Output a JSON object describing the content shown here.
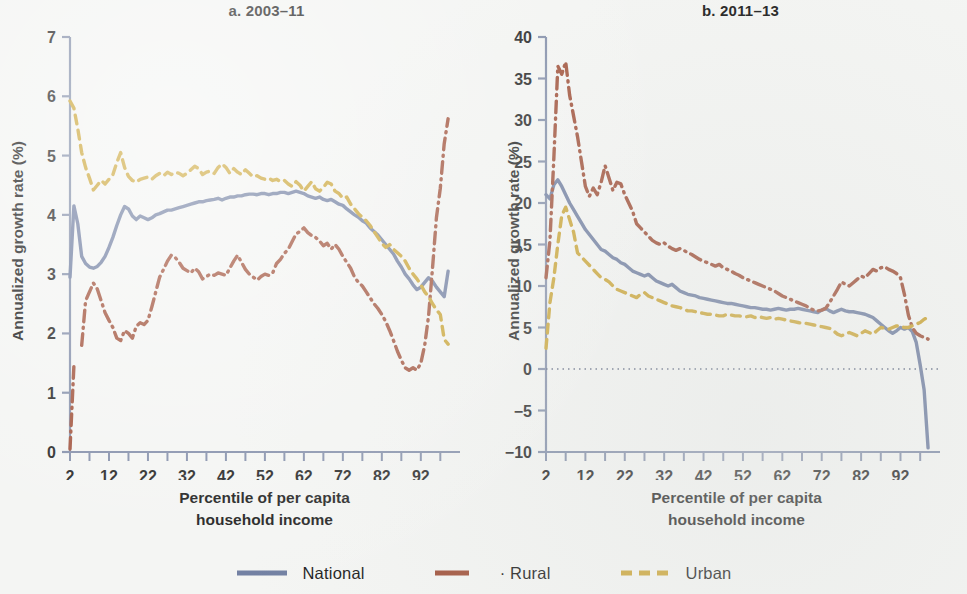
{
  "figure": {
    "background_color": "#f4f5f3",
    "legend": {
      "items": [
        {
          "label": "National",
          "color": "#6b7a9e",
          "style": "solid"
        },
        {
          "label": "· Rural",
          "color": "#9d4b33",
          "style": "dash-dot"
        },
        {
          "label": "Urban",
          "color": "#c9a12c",
          "style": "dashed"
        }
      ]
    }
  },
  "panels": {
    "a": {
      "title": "a. 2003–11",
      "xlabel_line1": "Percentile of per capita",
      "xlabel_line2": "household income",
      "ylabel": "Annualized growth rate (%)",
      "yticks": [
        "0",
        "1",
        "2",
        "3",
        "4",
        "5",
        "6",
        "7"
      ],
      "xticks": [
        "2",
        "12",
        "22",
        "32",
        "42",
        "52",
        "62",
        "72",
        "82",
        "92"
      ]
    },
    "b": {
      "title": "b. 2011–13",
      "xlabel_line1": "Percentile of per capita",
      "xlabel_line2": "household income",
      "ylabel": "Annualized growth rate (%)",
      "yticks": [
        "−10",
        "−5",
        "0",
        "5",
        "10",
        "15",
        "20",
        "25",
        "30",
        "35",
        "40"
      ],
      "xticks": [
        "2",
        "12",
        "22",
        "32",
        "42",
        "52",
        "62",
        "72",
        "82",
        "92"
      ]
    }
  },
  "chart_data": [
    {
      "id": "a",
      "type": "line",
      "title": "a. 2003–11",
      "xlabel": "Percentile of per capita household income",
      "ylabel": "Annualized growth rate (%)",
      "xlim": [
        2,
        100
      ],
      "ylim": [
        0,
        7
      ],
      "ytick_values": [
        0,
        1,
        2,
        3,
        4,
        5,
        6,
        7
      ],
      "xtick_values": [
        2,
        12,
        22,
        32,
        42,
        52,
        62,
        72,
        82,
        92
      ],
      "xtick_minor_step": 5,
      "grid": false,
      "zero_line": false,
      "legend_position": "below-figure",
      "x": [
        2,
        3,
        4,
        5,
        6,
        7,
        8,
        9,
        10,
        11,
        12,
        13,
        14,
        15,
        16,
        17,
        18,
        19,
        20,
        21,
        22,
        23,
        24,
        25,
        26,
        27,
        28,
        29,
        30,
        31,
        32,
        33,
        34,
        35,
        36,
        37,
        38,
        39,
        40,
        41,
        42,
        43,
        44,
        45,
        46,
        47,
        48,
        49,
        50,
        51,
        52,
        53,
        54,
        55,
        56,
        57,
        58,
        59,
        60,
        61,
        62,
        63,
        64,
        65,
        66,
        67,
        68,
        69,
        70,
        71,
        72,
        73,
        74,
        75,
        76,
        77,
        78,
        79,
        80,
        81,
        82,
        83,
        84,
        85,
        86,
        87,
        88,
        89,
        90,
        91,
        92,
        93,
        94,
        95,
        96,
        97,
        98,
        99
      ],
      "series": [
        {
          "name": "National",
          "color": "#6b7a9e",
          "style": "solid",
          "values": [
            2.95,
            4.15,
            3.85,
            3.3,
            3.18,
            3.12,
            3.1,
            3.13,
            3.2,
            3.3,
            3.45,
            3.62,
            3.82,
            4.0,
            4.14,
            4.1,
            3.98,
            3.92,
            3.98,
            3.95,
            3.92,
            3.95,
            4.0,
            4.02,
            4.05,
            4.08,
            4.08,
            4.1,
            4.12,
            4.14,
            4.16,
            4.18,
            4.2,
            4.22,
            4.22,
            4.24,
            4.25,
            4.26,
            4.28,
            4.25,
            4.28,
            4.3,
            4.3,
            4.32,
            4.32,
            4.34,
            4.35,
            4.35,
            4.34,
            4.36,
            4.36,
            4.34,
            4.36,
            4.36,
            4.38,
            4.38,
            4.36,
            4.38,
            4.4,
            4.38,
            4.36,
            4.32,
            4.3,
            4.28,
            4.3,
            4.26,
            4.24,
            4.26,
            4.22,
            4.18,
            4.16,
            4.1,
            4.05,
            4.0,
            3.96,
            3.9,
            3.86,
            3.78,
            3.72,
            3.66,
            3.58,
            3.5,
            3.42,
            3.34,
            3.22,
            3.12,
            3.0,
            2.92,
            2.82,
            2.74,
            2.78,
            2.86,
            2.94,
            2.88,
            2.78,
            2.7,
            2.62,
            3.05
          ]
        },
        {
          "name": "Rural",
          "color": "#9d4b33",
          "style": "dash-dot",
          "values": [
            0.05,
            1.45,
            null,
            1.8,
            2.55,
            2.7,
            2.85,
            2.75,
            2.55,
            2.35,
            2.22,
            2.1,
            1.92,
            1.88,
            2.05,
            2.0,
            1.92,
            2.12,
            2.18,
            2.15,
            2.22,
            2.45,
            2.7,
            2.95,
            3.08,
            3.22,
            3.32,
            3.28,
            3.2,
            3.1,
            3.06,
            3.02,
            3.1,
            3.04,
            2.92,
            2.96,
            3.0,
            2.98,
            3.02,
            3.0,
            2.98,
            3.1,
            3.22,
            3.32,
            3.2,
            3.08,
            3.0,
            2.95,
            2.9,
            2.96,
            3.0,
            2.98,
            3.02,
            3.18,
            3.25,
            3.35,
            3.42,
            3.55,
            3.68,
            3.72,
            3.78,
            3.7,
            3.65,
            3.62,
            3.56,
            3.48,
            3.52,
            3.42,
            3.5,
            3.42,
            3.3,
            3.2,
            3.1,
            2.95,
            2.86,
            2.8,
            2.7,
            2.6,
            2.5,
            2.42,
            2.32,
            2.2,
            2.05,
            1.88,
            1.7,
            1.55,
            1.42,
            1.38,
            1.42,
            1.38,
            1.5,
            1.8,
            2.3,
            3.1,
            3.95,
            4.45,
            5.2,
            5.62
          ]
        },
        {
          "name": "Urban",
          "color": "#c9a12c",
          "style": "dashed",
          "values": [
            5.92,
            5.8,
            5.45,
            5.05,
            4.8,
            4.62,
            4.42,
            4.5,
            4.58,
            4.52,
            4.6,
            4.68,
            4.88,
            5.05,
            4.8,
            4.65,
            4.58,
            4.55,
            4.6,
            4.62,
            4.64,
            4.6,
            4.66,
            4.7,
            4.66,
            4.72,
            4.68,
            4.72,
            4.7,
            4.66,
            4.7,
            4.76,
            4.82,
            4.78,
            4.68,
            4.72,
            4.74,
            4.7,
            4.8,
            4.86,
            4.8,
            4.7,
            4.78,
            4.72,
            4.68,
            4.76,
            4.7,
            4.64,
            4.66,
            4.62,
            4.6,
            4.62,
            4.58,
            4.6,
            4.56,
            4.58,
            4.52,
            4.48,
            4.56,
            4.5,
            4.4,
            4.48,
            4.56,
            4.44,
            4.4,
            4.46,
            4.55,
            4.52,
            4.4,
            4.36,
            4.28,
            4.3,
            4.18,
            4.1,
            4.02,
            3.96,
            3.9,
            3.82,
            3.72,
            3.62,
            3.52,
            3.45,
            3.5,
            3.42,
            3.36,
            3.3,
            3.22,
            3.1,
            3.0,
            2.92,
            2.82,
            2.7,
            2.62,
            2.5,
            2.4,
            2.32,
            1.9,
            1.82
          ]
        }
      ]
    },
    {
      "id": "b",
      "type": "line",
      "title": "b. 2011–13",
      "xlabel": "Percentile of per capita household income",
      "ylabel": "Annualized growth rate (%)",
      "xlim": [
        2,
        100
      ],
      "ylim": [
        -10,
        40
      ],
      "ytick_values": [
        -10,
        -5,
        0,
        5,
        10,
        15,
        20,
        25,
        30,
        35,
        40
      ],
      "xtick_values": [
        2,
        12,
        22,
        32,
        42,
        52,
        62,
        72,
        82,
        92
      ],
      "xtick_minor_step": 5,
      "grid": false,
      "zero_line": true,
      "legend_position": "below-figure",
      "x": [
        2,
        3,
        4,
        5,
        6,
        7,
        8,
        9,
        10,
        11,
        12,
        13,
        14,
        15,
        16,
        17,
        18,
        19,
        20,
        21,
        22,
        23,
        24,
        25,
        26,
        27,
        28,
        29,
        30,
        31,
        32,
        33,
        34,
        35,
        36,
        37,
        38,
        39,
        40,
        41,
        42,
        43,
        44,
        45,
        46,
        47,
        48,
        49,
        50,
        51,
        52,
        53,
        54,
        55,
        56,
        57,
        58,
        59,
        60,
        61,
        62,
        63,
        64,
        65,
        66,
        67,
        68,
        69,
        70,
        71,
        72,
        73,
        74,
        75,
        76,
        77,
        78,
        79,
        80,
        81,
        82,
        83,
        84,
        85,
        86,
        87,
        88,
        89,
        90,
        91,
        92,
        93,
        94,
        95,
        96,
        97,
        98,
        99
      ],
      "series": [
        {
          "name": "National",
          "color": "#6b7a9e",
          "style": "solid",
          "values": [
            21.0,
            20.5,
            22.2,
            22.8,
            22.0,
            21.0,
            20.0,
            19.2,
            18.4,
            17.6,
            16.8,
            16.2,
            15.6,
            15.0,
            14.4,
            14.2,
            13.8,
            13.4,
            13.2,
            12.8,
            12.6,
            12.2,
            11.8,
            11.6,
            11.4,
            11.2,
            11.4,
            11.0,
            10.6,
            10.4,
            10.2,
            10.0,
            10.2,
            9.8,
            9.4,
            9.2,
            9.0,
            8.9,
            8.8,
            8.6,
            8.5,
            8.4,
            8.3,
            8.2,
            8.1,
            8.0,
            7.9,
            7.9,
            7.8,
            7.7,
            7.6,
            7.5,
            7.4,
            7.4,
            7.3,
            7.2,
            7.2,
            7.1,
            7.2,
            7.3,
            7.2,
            7.1,
            7.2,
            7.2,
            7.3,
            7.2,
            7.1,
            7.0,
            6.9,
            6.8,
            7.1,
            7.3,
            7.0,
            6.8,
            7.0,
            7.2,
            7.0,
            6.9,
            6.9,
            6.8,
            6.7,
            6.6,
            6.4,
            6.2,
            5.8,
            5.4,
            5.0,
            4.6,
            4.3,
            4.6,
            5.0,
            4.8,
            5.0,
            4.5,
            3.2,
            0.5,
            -2.5,
            -9.5
          ]
        },
        {
          "name": "Rural",
          "color": "#9d4b33",
          "style": "dash-dot",
          "values": [
            11.0,
            15.5,
            25.5,
            36.5,
            35.5,
            37.0,
            33.0,
            30.5,
            28.0,
            25.0,
            22.0,
            20.8,
            21.8,
            21.0,
            22.5,
            24.5,
            23.0,
            21.5,
            22.5,
            22.3,
            21.0,
            20.0,
            19.0,
            17.5,
            17.0,
            16.5,
            16.0,
            15.5,
            15.2,
            15.0,
            15.2,
            14.8,
            14.5,
            14.3,
            14.5,
            14.3,
            14.0,
            13.8,
            13.5,
            13.2,
            13.0,
            12.8,
            12.6,
            12.4,
            12.6,
            12.2,
            12.0,
            11.8,
            11.5,
            11.3,
            11.0,
            10.8,
            10.6,
            10.4,
            10.2,
            10.0,
            9.8,
            9.6,
            9.4,
            9.1,
            8.8,
            8.6,
            8.4,
            8.2,
            8.0,
            7.8,
            7.6,
            7.3,
            7.1,
            7.0,
            7.1,
            7.3,
            8.0,
            8.8,
            9.6,
            10.5,
            10.2,
            10.0,
            10.4,
            10.8,
            11.2,
            11.0,
            11.5,
            12.0,
            11.8,
            12.2,
            12.3,
            12.0,
            11.8,
            11.5,
            11.0,
            9.0,
            6.5,
            5.0,
            4.3,
            4.0,
            3.8,
            3.6
          ]
        },
        {
          "name": "Urban",
          "color": "#c9a12c",
          "style": "dashed",
          "values": [
            2.5,
            8.0,
            11.0,
            15.0,
            18.5,
            19.5,
            18.0,
            16.5,
            14.0,
            13.5,
            13.0,
            12.5,
            12.0,
            11.5,
            11.0,
            10.8,
            10.5,
            10.0,
            9.6,
            9.4,
            9.2,
            9.0,
            8.8,
            8.6,
            9.0,
            9.2,
            8.8,
            8.6,
            8.4,
            8.2,
            8.0,
            7.8,
            7.6,
            7.5,
            7.4,
            7.2,
            7.0,
            7.0,
            6.9,
            6.8,
            6.7,
            6.6,
            6.6,
            6.5,
            6.4,
            6.4,
            6.6,
            6.5,
            6.4,
            6.4,
            6.3,
            6.3,
            6.4,
            6.2,
            6.3,
            6.2,
            6.1,
            6.2,
            6.0,
            6.1,
            6.0,
            5.9,
            5.8,
            5.7,
            5.6,
            5.5,
            5.5,
            5.4,
            5.3,
            5.2,
            5.1,
            5.0,
            4.9,
            4.6,
            4.2,
            4.0,
            4.2,
            4.4,
            4.2,
            4.0,
            4.3,
            4.6,
            4.4,
            4.2,
            4.6,
            5.0,
            4.9,
            4.8,
            5.0,
            5.2,
            5.1,
            5.0,
            5.0,
            5.2,
            5.4,
            5.6,
            6.0,
            6.2
          ]
        }
      ]
    }
  ]
}
